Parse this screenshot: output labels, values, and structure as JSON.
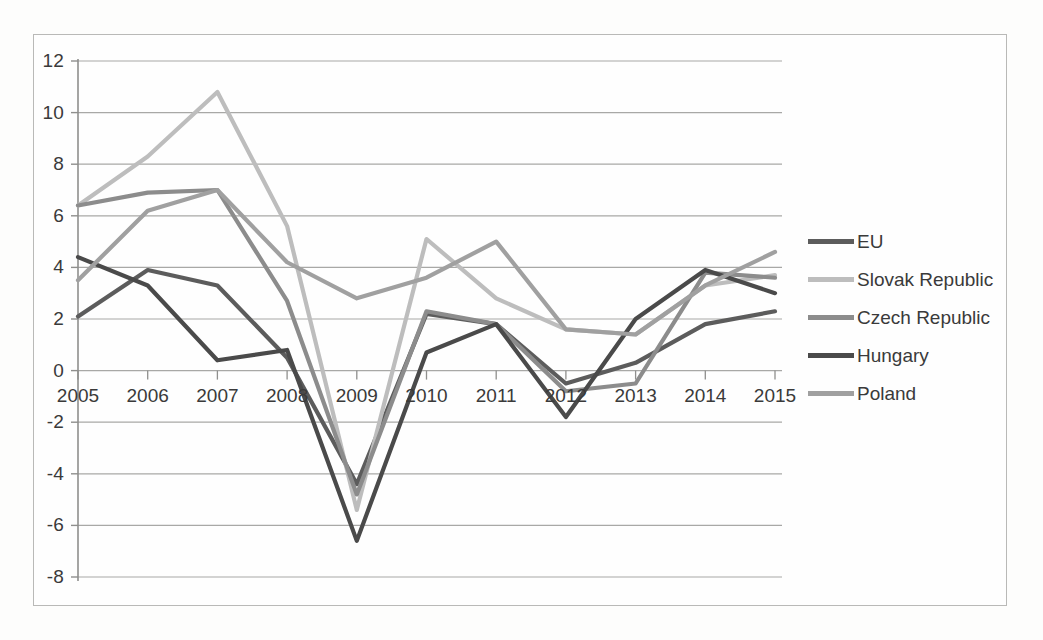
{
  "chart_data": {
    "type": "line",
    "title": "",
    "subtitle": "",
    "xlabel": "",
    "ylabel": "",
    "categories": [
      "2005",
      "2006",
      "2007",
      "2008",
      "2009",
      "2010",
      "2011",
      "2012",
      "2013",
      "2014",
      "2015"
    ],
    "x": [
      2005,
      2006,
      2007,
      2008,
      2009,
      2010,
      2011,
      2012,
      2013,
      2014,
      2015
    ],
    "ylim": [
      -8,
      12
    ],
    "ytick_labels": [
      "12",
      "10",
      "8",
      "6",
      "4",
      "2",
      "0",
      "-2",
      "-4",
      "-6",
      "-8"
    ],
    "yticks": [
      12,
      10,
      8,
      6,
      4,
      2,
      0,
      -2,
      -4,
      -6,
      -8
    ],
    "ytick_step": 2,
    "grid": "horizontal",
    "legend_position": "right",
    "series": [
      {
        "name": "EU",
        "color": "#5c5c5c",
        "values": [
          2.1,
          3.9,
          3.3,
          0.5,
          -4.4,
          2.2,
          1.8,
          -0.5,
          0.3,
          1.8,
          2.3
        ]
      },
      {
        "name": "Slovak Republic",
        "color": "#bdbdbd",
        "values": [
          6.4,
          8.3,
          10.8,
          5.6,
          -5.4,
          5.1,
          2.8,
          1.6,
          1.4,
          3.3,
          3.7
        ]
      },
      {
        "name": "Czech Republic",
        "color": "#8c8c8c",
        "values": [
          6.4,
          6.9,
          7.0,
          2.7,
          -4.8,
          2.3,
          1.8,
          -0.8,
          -0.5,
          3.8,
          3.6
        ]
      },
      {
        "name": "Hungary",
        "color": "#4a4a4a",
        "values": [
          4.4,
          3.3,
          0.4,
          0.8,
          -6.6,
          0.7,
          1.8,
          -1.8,
          2.0,
          3.9,
          3.0
        ]
      },
      {
        "name": "Poland",
        "color": "#a0a0a0",
        "values": [
          3.5,
          6.2,
          7.0,
          4.2,
          2.8,
          3.6,
          5.0,
          1.6,
          1.4,
          3.3,
          4.6
        ]
      }
    ]
  },
  "legend": {
    "items": [
      {
        "label": "EU"
      },
      {
        "label": "Slovak Republic"
      },
      {
        "label": "Czech Republic"
      },
      {
        "label": "Hungary"
      },
      {
        "label": "Poland"
      }
    ]
  }
}
